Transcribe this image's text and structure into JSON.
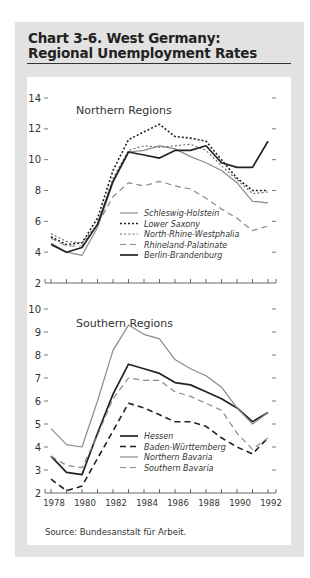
{
  "header": {
    "title_line1": "Chart 3-6.  West Germany:",
    "title_line2": "Regional Unemployment Rates"
  },
  "source": "Source:  Bundesanstalt für Arbeit.",
  "chart_data": [
    {
      "type": "line",
      "title": "Northern Regions",
      "xlabel": "",
      "ylabel": "",
      "x": [
        1978,
        1979,
        1980,
        1981,
        1982,
        1983,
        1984,
        1985,
        1986,
        1987,
        1988,
        1989,
        1990,
        1991,
        1992
      ],
      "ylim": [
        2,
        14
      ],
      "yticks": [
        2,
        4,
        6,
        8,
        10,
        12,
        14
      ],
      "grid": false,
      "legend_position": "lower-center",
      "series": [
        {
          "name": "Schleswig-Holstein",
          "style": "solid",
          "color": "#8a8a8a",
          "values": [
            4.6,
            4.0,
            3.8,
            5.6,
            8.5,
            10.5,
            10.6,
            10.9,
            10.7,
            10.2,
            9.8,
            9.3,
            8.5,
            7.3,
            7.2
          ]
        },
        {
          "name": "Lower Saxony",
          "style": "dotted-heavy",
          "color": "#222222",
          "values": [
            5.0,
            4.5,
            4.6,
            6.2,
            9.3,
            11.3,
            11.8,
            12.3,
            11.5,
            11.4,
            11.2,
            10.0,
            8.8,
            8.0,
            8.0
          ]
        },
        {
          "name": "North-Rhine-Westphalia",
          "style": "dotted-light",
          "color": "#666666",
          "values": [
            5.2,
            4.7,
            4.6,
            5.8,
            8.8,
            10.6,
            10.9,
            10.8,
            10.9,
            11.0,
            10.6,
            9.6,
            8.7,
            7.8,
            7.9
          ]
        },
        {
          "name": "Rhineland-Palatinate",
          "style": "dashed",
          "color": "#8a8a8a",
          "values": [
            4.9,
            4.4,
            4.4,
            5.8,
            7.6,
            8.5,
            8.3,
            8.6,
            8.3,
            8.1,
            7.5,
            6.8,
            6.2,
            5.4,
            5.7
          ]
        },
        {
          "name": "Berlin-Brandenburg",
          "style": "solid-heavy",
          "color": "#222222",
          "values": [
            4.5,
            4.0,
            4.3,
            5.8,
            8.6,
            10.5,
            10.3,
            10.1,
            10.6,
            10.6,
            10.9,
            9.8,
            9.5,
            9.5,
            11.2
          ]
        }
      ]
    },
    {
      "type": "line",
      "title": "Southern Regions",
      "xlabel": "",
      "ylabel": "",
      "x": [
        1978,
        1979,
        1980,
        1981,
        1982,
        1983,
        1984,
        1985,
        1986,
        1987,
        1988,
        1989,
        1990,
        1991,
        1992
      ],
      "xtick_labels": [
        "1978",
        "1980",
        "1982",
        "1984",
        "1986",
        "1988",
        "1990",
        "1992"
      ],
      "ylim": [
        2,
        10
      ],
      "yticks": [
        2,
        3,
        4,
        5,
        6,
        7,
        8,
        9,
        10
      ],
      "grid": false,
      "legend_position": "lower-center",
      "series": [
        {
          "name": "Hessen",
          "style": "solid-heavy",
          "color": "#222222",
          "values": [
            3.6,
            2.9,
            2.8,
            4.6,
            6.3,
            7.6,
            7.4,
            7.2,
            6.8,
            6.7,
            6.4,
            6.1,
            5.7,
            5.1,
            5.5
          ]
        },
        {
          "name": "Baden-Württemberg",
          "style": "dashed-heavy",
          "color": "#222222",
          "values": [
            2.6,
            2.1,
            2.3,
            3.5,
            4.7,
            5.9,
            5.7,
            5.4,
            5.1,
            5.1,
            4.9,
            4.4,
            4.0,
            3.7,
            4.4
          ]
        },
        {
          "name": "Northern Bavaria",
          "style": "solid",
          "color": "#8a8a8a",
          "values": [
            4.8,
            4.1,
            4.0,
            6.0,
            8.2,
            9.3,
            8.9,
            8.7,
            7.8,
            7.4,
            7.1,
            6.6,
            5.7,
            5.0,
            5.5
          ]
        },
        {
          "name": "Southern Bavaria",
          "style": "dashed",
          "color": "#8a8a8a",
          "values": [
            3.6,
            3.2,
            3.1,
            4.5,
            6.1,
            7.0,
            6.9,
            6.9,
            6.4,
            6.2,
            5.9,
            5.6,
            4.6,
            3.9,
            4.4
          ]
        }
      ]
    }
  ]
}
